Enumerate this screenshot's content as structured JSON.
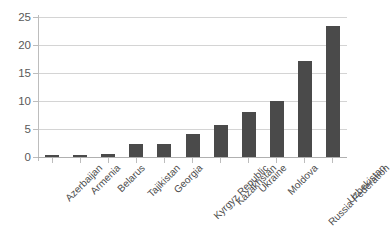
{
  "chart_data": {
    "type": "bar",
    "title": "",
    "subtitle": "",
    "xlabel": "",
    "ylabel": "",
    "ylim": [
      0,
      25
    ],
    "yticks": [
      0,
      5,
      10,
      15,
      20,
      25
    ],
    "ytick_labels": [
      "0",
      "5",
      "10",
      "15",
      "20",
      "25"
    ],
    "grid": true,
    "legend": false,
    "legend_position": "none",
    "bar_color": "#4a4a4a",
    "gridline_color": "#d4d4d4",
    "axis_color": "#b0b0b0",
    "categories": [
      "Azerbaijan",
      "Armenia",
      "Belarus",
      "Tajikistan",
      "Georgia",
      "Kyrgyz Republic",
      "Kazakhstan",
      "Ukraine",
      "Moldova",
      "Russia Federation",
      "Uzbekistan"
    ],
    "values": [
      0.3,
      0.4,
      0.5,
      2.3,
      2.3,
      4.1,
      5.7,
      8.1,
      10.0,
      17.1,
      23.4
    ]
  }
}
